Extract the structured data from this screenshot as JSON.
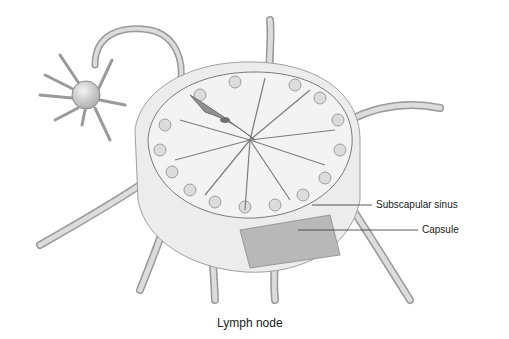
{
  "figure": {
    "title": "Lymph node",
    "labels": [
      {
        "id": "subscapular-sinus",
        "text": "Subscapular sinus"
      },
      {
        "id": "capsule",
        "text": "Capsule"
      }
    ]
  },
  "colors": {
    "background": "#ffffff",
    "tissue_light": "#e9e9e9",
    "tissue_mid": "#c8c8c8",
    "tissue_dark": "#8f8f8f",
    "vessel": "#bdbdbd",
    "line": "#2a2a2a"
  }
}
